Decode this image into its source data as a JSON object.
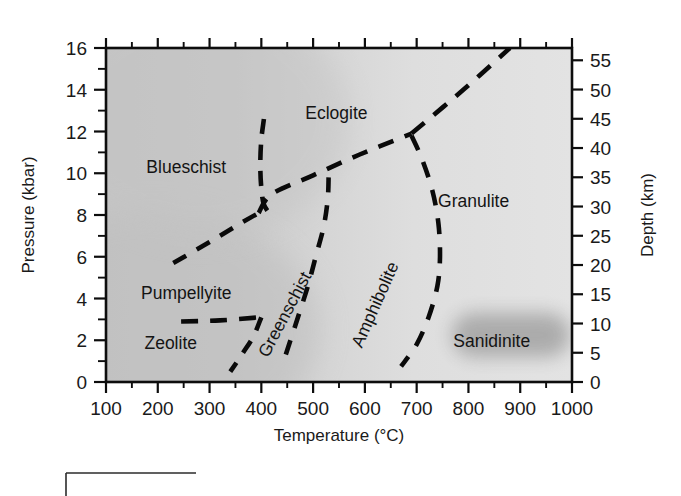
{
  "figure": {
    "background_color": "#ffffff",
    "plot_fill_left": "#c9c9c9",
    "plot_fill_right": "#e2e2e2",
    "line_color": "#0a0a0a"
  },
  "chart_data": {
    "type": "line",
    "title": "",
    "xlabel": "Temperature (°C)",
    "ylabel": "Pressure (kbar)",
    "y2label": "Depth (km)",
    "xlim": [
      100,
      1000
    ],
    "ylim": [
      0,
      16
    ],
    "y2lim": [
      0,
      57.1
    ],
    "grid": false,
    "legend": "none",
    "xticks": [
      100,
      200,
      300,
      400,
      500,
      600,
      700,
      800,
      900,
      1000
    ],
    "xtick_labels": [
      "100",
      "200",
      "300",
      "400",
      "500",
      "600",
      "700",
      "800",
      "900",
      "1000"
    ],
    "yticks": [
      0,
      2,
      4,
      6,
      8,
      10,
      12,
      14,
      16
    ],
    "ytick_labels": [
      "0",
      "2",
      "4",
      "6",
      "8",
      "10",
      "12",
      "14",
      "16"
    ],
    "yticks_minor": [
      1,
      3,
      5,
      7,
      9,
      11,
      13,
      15
    ],
    "y2ticks": [
      0,
      5,
      10,
      15,
      20,
      25,
      30,
      35,
      40,
      45,
      50,
      55
    ],
    "y2tick_labels": [
      "0",
      "5",
      "10",
      "15",
      "20",
      "25",
      "30",
      "35",
      "40",
      "45",
      "50",
      "55"
    ],
    "xticks_minor": [
      150,
      250,
      350,
      450,
      550,
      650,
      750,
      850,
      950
    ],
    "annotations": [
      {
        "name": "blueschist",
        "text": "Blueschist",
        "x": 255,
        "y": 10.0,
        "rotation": 0
      },
      {
        "name": "eclogite",
        "text": "Eclogite",
        "x": 545,
        "y": 12.6,
        "rotation": 0
      },
      {
        "name": "granulite",
        "text": "Granulite",
        "x": 810,
        "y": 8.4,
        "rotation": 0
      },
      {
        "name": "pumpellyite",
        "text": "Pumpellyite",
        "x": 255,
        "y": 4.0,
        "rotation": 0
      },
      {
        "name": "zeolite",
        "text": "Zeolite",
        "x": 225,
        "y": 1.6,
        "rotation": 0
      },
      {
        "name": "greenschist",
        "text": "Greenschist",
        "x": 455,
        "y": 3.1,
        "rotation": -62
      },
      {
        "name": "amphibolite",
        "text": "Amphibolite",
        "x": 630,
        "y": 3.6,
        "rotation": -66
      },
      {
        "name": "sanidinite",
        "text": "Sanidinite",
        "x": 845,
        "y": 1.7,
        "rotation": 0
      }
    ],
    "boundaries": [
      {
        "name": "pumpellyite-blueschist",
        "style": "dashed",
        "points": [
          [
            230,
            5.7
          ],
          [
            300,
            6.7
          ],
          [
            360,
            7.6
          ],
          [
            395,
            8.1
          ]
        ]
      },
      {
        "name": "blueschist-greenschist-amphibolite",
        "style": "dashed",
        "points": [
          [
            395,
            8.1
          ],
          [
            420,
            9.0
          ],
          [
            500,
            9.9
          ],
          [
            590,
            10.9
          ],
          [
            690,
            11.9
          ]
        ]
      },
      {
        "name": "eclogite-granulite",
        "style": "dashed",
        "points": [
          [
            690,
            11.9
          ],
          [
            790,
            14.0
          ],
          [
            880,
            16.0
          ]
        ]
      },
      {
        "name": "blueschist-eclogite",
        "style": "dashed",
        "points": [
          [
            405,
            12.6
          ],
          [
            400,
            11.6
          ],
          [
            398,
            10.4
          ],
          [
            400,
            9.3
          ],
          [
            405,
            8.5
          ],
          [
            418,
            8.0
          ]
        ]
      },
      {
        "name": "greenschist-amphibolite-upper",
        "style": "dashed",
        "points": [
          [
            530,
            9.8
          ],
          [
            528,
            8.7
          ],
          [
            520,
            7.4
          ],
          [
            505,
            6.0
          ],
          [
            490,
            4.6
          ],
          [
            472,
            3.2
          ],
          [
            455,
            1.9
          ],
          [
            440,
            0.75
          ]
        ]
      },
      {
        "name": "amphibolite-granulite",
        "style": "dashed",
        "points": [
          [
            690,
            11.8
          ],
          [
            710,
            10.7
          ],
          [
            730,
            9.2
          ],
          [
            742,
            7.6
          ],
          [
            745,
            6.0
          ],
          [
            740,
            4.6
          ],
          [
            723,
            3.1
          ],
          [
            700,
            1.8
          ],
          [
            670,
            0.75
          ]
        ]
      },
      {
        "name": "zeolite-greenschist",
        "style": "dashed",
        "points": [
          [
            400,
            3.1
          ],
          [
            385,
            2.2
          ],
          [
            362,
            1.3
          ],
          [
            340,
            0.5
          ]
        ]
      },
      {
        "name": "zeolite-pumpellyite",
        "style": "dashed",
        "points": [
          [
            245,
            2.9
          ],
          [
            320,
            2.95
          ],
          [
            396,
            3.1
          ]
        ]
      }
    ],
    "regions": [
      {
        "name": "blueschist",
        "label": "Blueschist"
      },
      {
        "name": "eclogite",
        "label": "Eclogite"
      },
      {
        "name": "granulite",
        "label": "Granulite"
      },
      {
        "name": "amphibolite",
        "label": "Amphibolite"
      },
      {
        "name": "greenschist",
        "label": "Greenschist"
      },
      {
        "name": "pumpellyite",
        "label": "Pumpellyite"
      },
      {
        "name": "zeolite",
        "label": "Zeolite"
      },
      {
        "name": "sanidinite",
        "label": "Sanidinite"
      }
    ]
  }
}
